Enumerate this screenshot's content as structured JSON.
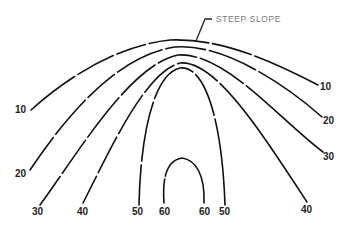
{
  "diagram": {
    "type": "contour-map",
    "annotation": "STEEP SLOPE",
    "contours": [
      {
        "value": "10",
        "left_label": "10",
        "right_label": "10"
      },
      {
        "value": "20",
        "left_label": "20",
        "right_label": "20"
      },
      {
        "value": "30",
        "left_label": "30",
        "right_label": "30"
      },
      {
        "value": "40",
        "left_label": "40",
        "right_label": "40"
      },
      {
        "value": "50",
        "left_label": "50",
        "right_label": "50"
      },
      {
        "value": "60",
        "left_label": "60",
        "right_label": "60"
      }
    ]
  }
}
